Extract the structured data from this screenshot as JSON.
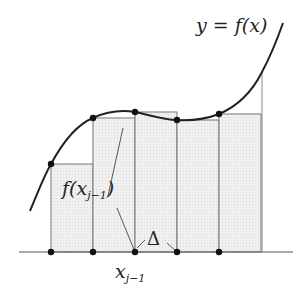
{
  "diagram": {
    "labels": {
      "curve_label": "y = f(x)",
      "height_label_f": "f(",
      "height_label_x": "x",
      "height_label_sub": "j−1",
      "height_label_close": ")",
      "width_label": "Δ",
      "point_label_x": "x",
      "point_label_sub": "j−1"
    },
    "baseline_y": 252,
    "partition_x": [
      51,
      93,
      135,
      177,
      219,
      261
    ],
    "rect_tops": [
      164,
      118,
      112,
      120,
      114
    ],
    "curve_points": [
      [
        30,
        211
      ],
      [
        51,
        164
      ],
      [
        93,
        118
      ],
      [
        135,
        112
      ],
      [
        177,
        120
      ],
      [
        219,
        114
      ],
      [
        262,
        72
      ],
      [
        283,
        23
      ]
    ],
    "colors": {
      "curve": "#222222",
      "rect_fill": "#ececec",
      "rect_stroke": "#777777",
      "axis": "#555555",
      "dots": "#111111"
    }
  }
}
